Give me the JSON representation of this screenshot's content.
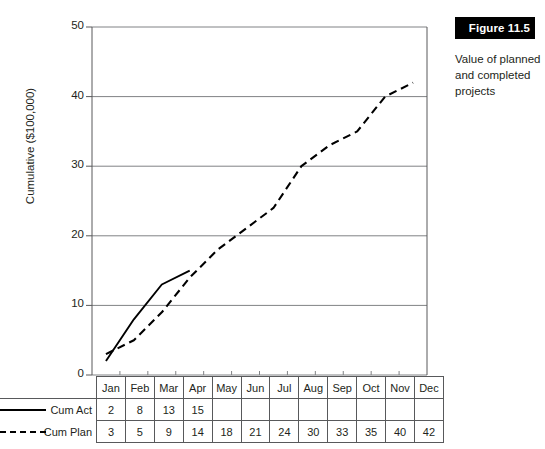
{
  "figure": {
    "badge_label": "Figure 11.5",
    "caption": "Value of planned and completed projects",
    "badge_bg": "#000000",
    "badge_fg": "#ffffff"
  },
  "chart_data": {
    "type": "line",
    "title": "",
    "xlabel": "",
    "ylabel": "Cumulative ($100,000)",
    "ylim": [
      0,
      50
    ],
    "yticks": [
      0,
      10,
      20,
      30,
      40,
      50
    ],
    "ytick_labels": [
      "0",
      "10",
      "20",
      "30",
      "40",
      "50"
    ],
    "grid": true,
    "legend_position": "table-left",
    "categories": [
      "Jan",
      "Feb",
      "Mar",
      "Apr",
      "May",
      "Jun",
      "Jul",
      "Aug",
      "Sep",
      "Oct",
      "Nov",
      "Dec"
    ],
    "series": [
      {
        "name": "Cum Act",
        "style": "solid",
        "color": "#000000",
        "values": [
          2,
          8,
          13,
          15,
          null,
          null,
          null,
          null,
          null,
          null,
          null,
          null
        ]
      },
      {
        "name": "Cum Plan",
        "style": "dashed",
        "color": "#000000",
        "values": [
          3,
          5,
          9,
          14,
          18,
          21,
          24,
          30,
          33,
          35,
          40,
          42
        ]
      }
    ]
  },
  "table": {
    "header_row": [
      "Jan",
      "Feb",
      "Mar",
      "Apr",
      "May",
      "Jun",
      "Jul",
      "Aug",
      "Sep",
      "Oct",
      "Nov",
      "Dec"
    ],
    "rows": [
      {
        "label": "Cum Act",
        "swatch": "solid-line-icon",
        "cells": [
          "2",
          "8",
          "13",
          "15",
          "",
          "",
          "",
          "",
          "",
          "",
          "",
          ""
        ]
      },
      {
        "label": "Cum Plan",
        "swatch": "dashed-line-icon",
        "cells": [
          "3",
          "5",
          "9",
          "14",
          "18",
          "21",
          "24",
          "30",
          "33",
          "35",
          "40",
          "42"
        ]
      }
    ]
  }
}
